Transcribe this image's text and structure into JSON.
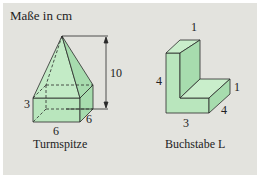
{
  "header": {
    "title": "Maße in cm"
  },
  "figures": [
    {
      "name": "Turmspitze",
      "caption": "Turmspitze",
      "dimensions": {
        "height_total": "10",
        "base_height": "3",
        "width": "6",
        "depth": "6"
      }
    },
    {
      "name": "Buchstabe L",
      "caption": "Buchstabe L",
      "dimensions": {
        "top_width": "1",
        "height": "4",
        "foot_height": "1",
        "depth": "4",
        "bottom_width": "3"
      }
    }
  ],
  "colors": {
    "panel": "#e3e3de",
    "fill": "#b9e6bd",
    "fill_dark": "#9fd8a6",
    "line": "#2a2a2a"
  }
}
